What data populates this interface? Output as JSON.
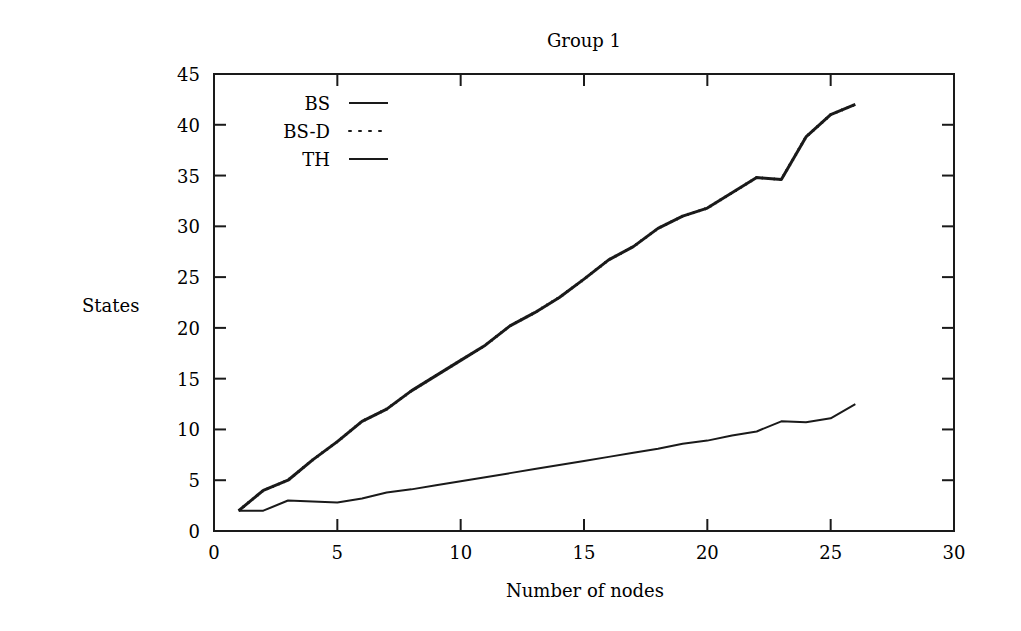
{
  "chart_data": {
    "type": "line",
    "title": "Group 1",
    "xlabel": "Number of nodes",
    "ylabel": "States",
    "xlim": [
      0,
      30
    ],
    "ylim": [
      0,
      45
    ],
    "xticks": [
      0,
      5,
      10,
      15,
      20,
      25,
      30
    ],
    "yticks": [
      0,
      5,
      10,
      15,
      20,
      25,
      30,
      35,
      40,
      45
    ],
    "grid": false,
    "legend_position": "upper-left",
    "legend": [
      {
        "label": "BS",
        "style": "solid"
      },
      {
        "label": "BS-D",
        "style": "dotted"
      },
      {
        "label": "TH",
        "style": "solid"
      }
    ],
    "x": [
      1,
      2,
      3,
      4,
      5,
      6,
      7,
      8,
      9,
      10,
      11,
      12,
      13,
      14,
      15,
      16,
      17,
      18,
      19,
      20,
      21,
      22,
      23,
      24,
      25,
      26
    ],
    "series": [
      {
        "name": "BS",
        "style": "solid",
        "width": 3,
        "values": [
          2,
          4,
          5,
          7,
          8.8,
          10.8,
          12,
          13.8,
          15.3,
          16.8,
          18.3,
          20.2,
          21.5,
          23,
          24.8,
          26.7,
          28,
          29.8,
          31,
          31.8,
          33.3,
          34.8,
          34.6,
          38.8,
          41,
          42
        ]
      },
      {
        "name": "BS-D",
        "style": "dotted",
        "width": 3,
        "values": [
          2,
          4,
          5,
          7,
          8.8,
          10.8,
          12,
          13.8,
          15.3,
          16.8,
          18.3,
          20.2,
          21.5,
          23,
          24.8,
          26.7,
          28,
          29.8,
          31,
          31.8,
          33.3,
          34.8,
          34.6,
          38.8,
          41,
          42
        ]
      },
      {
        "name": "TH",
        "style": "solid",
        "width": 2,
        "values": [
          2,
          2,
          3,
          2.9,
          2.8,
          3.2,
          3.8,
          4.1,
          4.5,
          4.9,
          5.3,
          5.7,
          6.1,
          6.5,
          6.9,
          7.3,
          7.7,
          8.1,
          8.6,
          8.9,
          9.4,
          9.8,
          10.8,
          10.7,
          11.1,
          12.5
        ]
      }
    ]
  }
}
